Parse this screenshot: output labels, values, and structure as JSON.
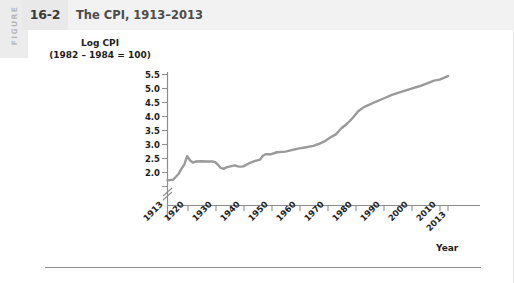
{
  "header": {
    "figure_word": "FIGURE",
    "figure_number": "16-2",
    "title": "The CPI, 1913–2013"
  },
  "chart_data": {
    "type": "line",
    "title": "The CPI, 1913–2013",
    "ylabel": "Log CPI\n(1982 – 1984 = 100)",
    "xlabel": "Year",
    "grid": false,
    "legend": "none",
    "line_color": "#9a9a9a",
    "axis_break": true,
    "ylim": [
      2.0,
      5.5
    ],
    "xlim": [
      1913,
      2013
    ],
    "yticks": [
      "5.5",
      "5.0",
      "4.5",
      "4.0",
      "3.5",
      "3.0",
      "2.5",
      "2.0"
    ],
    "ytick_values": [
      5.5,
      5.0,
      4.5,
      4.0,
      3.5,
      3.0,
      2.5,
      2.0
    ],
    "xticks": [
      "1913",
      "1920",
      "1930",
      "1940",
      "1950",
      "1960",
      "1970",
      "1980",
      "1990",
      "2000",
      "2010",
      "2013"
    ],
    "xtick_values": [
      1913,
      1920,
      1930,
      1940,
      1950,
      1960,
      1970,
      1980,
      1990,
      2000,
      2010,
      2013
    ],
    "x": [
      1913,
      1915,
      1917,
      1918,
      1919,
      1920,
      1921,
      1922,
      1923,
      1925,
      1927,
      1929,
      1930,
      1931,
      1932,
      1933,
      1934,
      1935,
      1937,
      1938,
      1939,
      1940,
      1942,
      1944,
      1946,
      1947,
      1948,
      1950,
      1952,
      1955,
      1958,
      1960,
      1962,
      1965,
      1967,
      1969,
      1971,
      1973,
      1975,
      1977,
      1979,
      1981,
      1983,
      1985,
      1987,
      1990,
      1993,
      1996,
      2000,
      2003,
      2006,
      2008,
      2010,
      2013
    ],
    "y": [
      2.19,
      2.21,
      2.4,
      2.56,
      2.68,
      2.95,
      2.82,
      2.75,
      2.78,
      2.79,
      2.78,
      2.78,
      2.76,
      2.68,
      2.58,
      2.55,
      2.6,
      2.62,
      2.66,
      2.63,
      2.62,
      2.63,
      2.72,
      2.79,
      2.84,
      2.96,
      3.01,
      3.01,
      3.07,
      3.09,
      3.15,
      3.19,
      3.22,
      3.27,
      3.33,
      3.41,
      3.53,
      3.63,
      3.82,
      3.96,
      4.14,
      4.35,
      4.48,
      4.56,
      4.64,
      4.75,
      4.86,
      4.95,
      5.06,
      5.14,
      5.24,
      5.31,
      5.34,
      5.45
    ],
    "annotations": []
  }
}
